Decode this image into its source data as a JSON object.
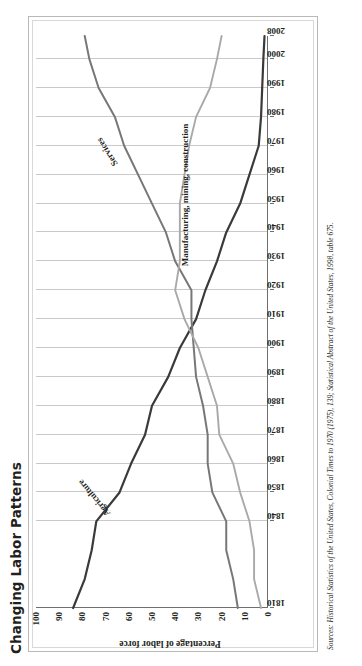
{
  "title": "Changing Labor Patterns",
  "source": "Sources: Historical Statistics of the United States, Colonial Times to 1970 (1975), 139; Statistical Abstract of the United States, 1998, table 675.",
  "axis": {
    "ylabel": "Percentage of labor force",
    "yticks": [
      "0",
      "10",
      "20",
      "30",
      "40",
      "50",
      "60",
      "70",
      "80",
      "90",
      "100"
    ],
    "xticks": [
      "1810",
      "1840",
      "1850",
      "1860",
      "1870",
      "1880",
      "1890",
      "1900",
      "1910",
      "1920",
      "1930",
      "1940",
      "1950",
      "1960",
      "1970",
      "1980",
      "1990",
      "2000",
      "2008"
    ]
  },
  "labels": {
    "agriculture": "Agriculture",
    "services": "Services",
    "manufacturing": "Manufacturing, mining, construction"
  },
  "colors": {
    "agriculture": "#3a3a3a",
    "services": "#777777",
    "manufacturing": "#a9a9a9",
    "grid": "#c9c9c9",
    "axis": "#6f6f6f",
    "text": "#231f20"
  },
  "chart_data": {
    "type": "line",
    "title": "Changing Labor Patterns",
    "xlabel": "",
    "ylabel": "Percentage of labor force",
    "xlim": [
      1810,
      2008
    ],
    "ylim": [
      0,
      100
    ],
    "grid": true,
    "legend": "inline-annotations",
    "x": [
      1810,
      1820,
      1830,
      1840,
      1850,
      1860,
      1870,
      1880,
      1890,
      1900,
      1910,
      1920,
      1930,
      1940,
      1950,
      1960,
      1970,
      1980,
      1990,
      2000,
      2008
    ],
    "series": [
      {
        "name": "Agriculture",
        "color": "#3a3a3a",
        "values": [
          84,
          79,
          76,
          74,
          64,
          59,
          53,
          50,
          43,
          38,
          31,
          27,
          22,
          18,
          12,
          8,
          4,
          3,
          2.5,
          2,
          1.5
        ]
      },
      {
        "name": "Services",
        "color": "#777777",
        "values": [
          13,
          15,
          18,
          18,
          24,
          26,
          26,
          28,
          31,
          32,
          33,
          33,
          40,
          44,
          50,
          56,
          62,
          66,
          73,
          77,
          79
        ]
      },
      {
        "name": "Manufacturing, mining, construction",
        "color": "#a9a9a9",
        "values": [
          3,
          6,
          6,
          8,
          12,
          15,
          21,
          22,
          26,
          30,
          36,
          40,
          38,
          38,
          38,
          36,
          34,
          31,
          25,
          22,
          20
        ]
      }
    ]
  }
}
